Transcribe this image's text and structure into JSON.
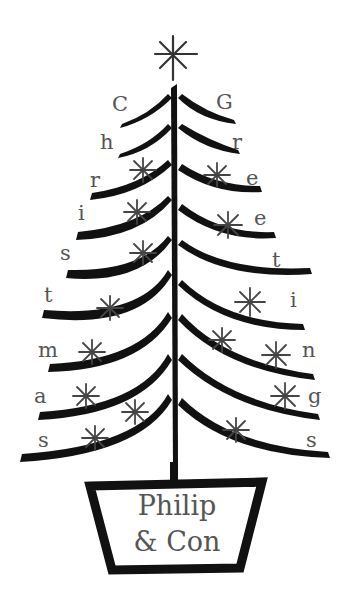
{
  "card": {
    "type": "calligraphic christmas tree illustration",
    "colors": {
      "ink": "#111111",
      "letters": "#555555",
      "stars": "#444444",
      "background": "#ffffff"
    },
    "left_letters": [
      "C",
      "h",
      "r",
      "i",
      "s",
      "t",
      "m",
      "a",
      "s"
    ],
    "right_letters": [
      "G",
      "r",
      "e",
      "e",
      "t",
      "i",
      "n",
      "g",
      "s"
    ],
    "left_word": "Christmas",
    "right_word": "Greetings",
    "pot": {
      "line1": "Philip",
      "line2": "& Con"
    },
    "top_icon": "star-asterisk-icon"
  }
}
